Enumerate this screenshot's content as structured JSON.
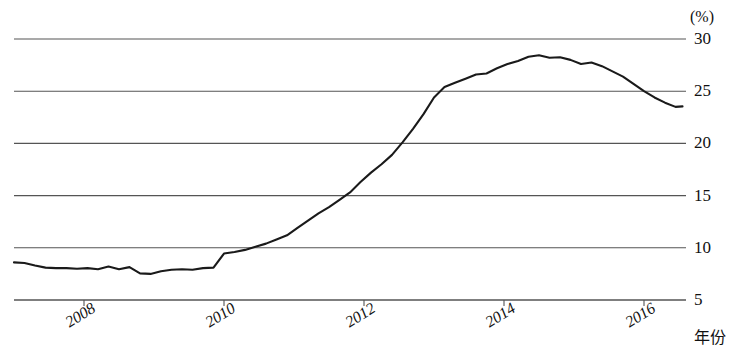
{
  "chart_data": {
    "type": "line",
    "title": "",
    "subtitle": "",
    "xlabel": "年份",
    "ylabel": "",
    "unit_label": "(%)",
    "grid": true,
    "legend": "none",
    "xlim": [
      2007.0,
      2016.6
    ],
    "ylim": [
      5,
      30
    ],
    "xticks": [
      2008,
      2010,
      2012,
      2014,
      2016
    ],
    "xtick_labels": [
      "2008",
      "2010",
      "2012",
      "2014",
      "2016"
    ],
    "yticks": [
      5,
      10,
      15,
      20,
      25,
      30
    ],
    "ytick_labels": [
      "5",
      "10",
      "15",
      "20",
      "25",
      "30"
    ],
    "line_color": "#1a1a1a",
    "grid_color": "#555555",
    "series": [
      {
        "name": "比例",
        "x": [
          2007.0,
          2007.15,
          2007.3,
          2007.45,
          2007.6,
          2007.75,
          2007.9,
          2008.05,
          2008.2,
          2008.35,
          2008.5,
          2008.65,
          2008.8,
          2008.95,
          2009.1,
          2009.25,
          2009.4,
          2009.55,
          2009.7,
          2009.85,
          2010.0,
          2010.15,
          2010.3,
          2010.45,
          2010.6,
          2010.75,
          2010.9,
          2011.05,
          2011.2,
          2011.35,
          2011.5,
          2011.65,
          2011.8,
          2011.95,
          2012.1,
          2012.25,
          2012.4,
          2012.55,
          2012.7,
          2012.85,
          2013.0,
          2013.15,
          2013.3,
          2013.45,
          2013.6,
          2013.75,
          2013.9,
          2014.05,
          2014.2,
          2014.35,
          2014.5,
          2014.65,
          2014.8,
          2014.95,
          2015.1,
          2015.25,
          2015.4,
          2015.55,
          2015.7,
          2015.85,
          2016.0,
          2016.15,
          2016.3,
          2016.45,
          2016.55
        ],
        "y": [
          8.6,
          8.55,
          8.3,
          8.1,
          8.05,
          8.05,
          8.0,
          8.05,
          7.95,
          8.2,
          7.95,
          8.15,
          7.55,
          7.5,
          7.75,
          7.9,
          7.95,
          7.9,
          8.05,
          8.1,
          9.45,
          9.6,
          9.8,
          10.1,
          10.4,
          10.8,
          11.2,
          11.9,
          12.6,
          13.3,
          13.9,
          14.6,
          15.3,
          16.3,
          17.2,
          18.0,
          18.9,
          20.1,
          21.4,
          22.8,
          24.4,
          25.4,
          25.8,
          26.2,
          26.6,
          26.7,
          27.2,
          27.6,
          27.9,
          28.3,
          28.45,
          28.2,
          28.25,
          28.0,
          27.6,
          27.75,
          27.4,
          26.9,
          26.4,
          25.7,
          25.0,
          24.4,
          23.9,
          23.5,
          23.55
        ]
      }
    ]
  },
  "axis": {
    "unit": "(%)",
    "x_title": "年份"
  }
}
